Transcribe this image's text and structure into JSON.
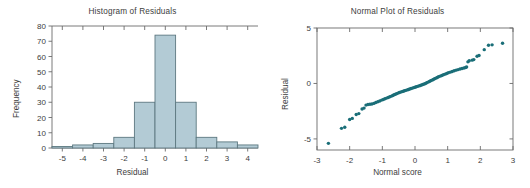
{
  "figure": {
    "panels": [
      "histogram-of-residuals",
      "normal-plot-of-residuals"
    ]
  },
  "colors": {
    "bar_fill": "#b3cbd5",
    "bar_edge": "#5d7880",
    "point": "#1a6e78",
    "axis": "#6b6b6b",
    "text": "#3d3d3d",
    "background": "#ffffff"
  },
  "histogram": {
    "title": "Histogram of Residuals",
    "xlabel": "Residual",
    "ylabel": "Frequency",
    "x_ticks": [
      "-5",
      "-4",
      "-3",
      "-2",
      "-1",
      "0",
      "1",
      "2",
      "3",
      "4"
    ],
    "y_ticks": [
      "0",
      "10",
      "20",
      "30",
      "40",
      "50",
      "60",
      "70",
      "80"
    ]
  },
  "normalplot": {
    "title": "Normal Plot of Residuals",
    "xlabel": "Normal score",
    "ylabel": "Residual",
    "x_ticks": [
      "-3",
      "-2",
      "-1",
      "0",
      "1",
      "2",
      "3"
    ],
    "y_ticks": [
      "-5",
      "0",
      "5"
    ]
  },
  "chart_data": [
    {
      "type": "bar",
      "title": "Histogram of Residuals",
      "xlabel": "Residual",
      "ylabel": "Frequency",
      "xlim": [
        -5.5,
        4.5
      ],
      "ylim": [
        0,
        80
      ],
      "grid": false,
      "legend": null,
      "bin_width": 1,
      "bin_centers": [
        -5,
        -4,
        -3,
        -2,
        -1,
        0,
        1,
        2,
        3,
        4
      ],
      "bin_edges": [
        -5.5,
        -4.5,
        -3.5,
        -2.5,
        -1.5,
        -0.5,
        0.5,
        1.5,
        2.5,
        3.5,
        4.5
      ],
      "categories": [
        "-5",
        "-4",
        "-3",
        "-2",
        "-1",
        "0",
        "1",
        "2",
        "3",
        "4"
      ],
      "values": [
        1,
        2,
        3,
        7,
        30,
        74,
        30,
        7,
        4,
        2
      ],
      "xtick_values": [
        -5,
        -4,
        -3,
        -2,
        -1,
        0,
        1,
        2,
        3,
        4
      ],
      "ytick_values": [
        0,
        10,
        20,
        30,
        40,
        50,
        60,
        70,
        80
      ]
    },
    {
      "type": "scatter",
      "title": "Normal Plot of Residuals",
      "xlabel": "Normal score",
      "ylabel": "Residual",
      "xlim": [
        -3,
        3
      ],
      "ylim": [
        -6,
        5
      ],
      "grid": false,
      "legend": null,
      "marker": "circle",
      "xtick_values": [
        -3,
        -2,
        -1,
        0,
        1,
        2,
        3
      ],
      "ytick_values": [
        -5,
        0,
        5
      ],
      "points": [
        [
          -2.65,
          -5.4
        ],
        [
          -2.25,
          -4.05
        ],
        [
          -2.15,
          -3.95
        ],
        [
          -2.0,
          -3.25
        ],
        [
          -1.92,
          -3.15
        ],
        [
          -1.8,
          -2.8
        ],
        [
          -1.72,
          -2.72
        ],
        [
          -1.62,
          -2.3
        ],
        [
          -1.56,
          -2.22
        ],
        [
          -1.5,
          -1.95
        ],
        [
          -1.44,
          -1.9
        ],
        [
          -1.38,
          -1.88
        ],
        [
          -1.32,
          -1.85
        ],
        [
          -1.26,
          -1.8
        ],
        [
          -1.2,
          -1.72
        ],
        [
          -1.14,
          -1.65
        ],
        [
          -1.08,
          -1.58
        ],
        [
          -1.02,
          -1.5
        ],
        [
          -0.97,
          -1.44
        ],
        [
          -0.92,
          -1.38
        ],
        [
          -0.87,
          -1.32
        ],
        [
          -0.82,
          -1.26
        ],
        [
          -0.77,
          -1.2
        ],
        [
          -0.72,
          -1.14
        ],
        [
          -0.68,
          -1.08
        ],
        [
          -0.64,
          -1.02
        ],
        [
          -0.6,
          -0.97
        ],
        [
          -0.56,
          -0.92
        ],
        [
          -0.52,
          -0.87
        ],
        [
          -0.48,
          -0.82
        ],
        [
          -0.44,
          -0.78
        ],
        [
          -0.4,
          -0.74
        ],
        [
          -0.36,
          -0.7
        ],
        [
          -0.32,
          -0.66
        ],
        [
          -0.28,
          -0.62
        ],
        [
          -0.24,
          -0.58
        ],
        [
          -0.2,
          -0.54
        ],
        [
          -0.16,
          -0.5
        ],
        [
          -0.12,
          -0.46
        ],
        [
          -0.08,
          -0.42
        ],
        [
          -0.04,
          -0.38
        ],
        [
          0.0,
          -0.34
        ],
        [
          0.04,
          -0.3
        ],
        [
          0.08,
          -0.26
        ],
        [
          0.12,
          -0.22
        ],
        [
          0.16,
          -0.18
        ],
        [
          0.2,
          -0.14
        ],
        [
          0.24,
          -0.1
        ],
        [
          0.28,
          -0.05
        ],
        [
          0.32,
          0.0
        ],
        [
          0.36,
          0.06
        ],
        [
          0.4,
          0.12
        ],
        [
          0.44,
          0.18
        ],
        [
          0.48,
          0.24
        ],
        [
          0.52,
          0.3
        ],
        [
          0.56,
          0.36
        ],
        [
          0.6,
          0.42
        ],
        [
          0.64,
          0.48
        ],
        [
          0.68,
          0.54
        ],
        [
          0.72,
          0.6
        ],
        [
          0.77,
          0.66
        ],
        [
          0.82,
          0.72
        ],
        [
          0.87,
          0.78
        ],
        [
          0.92,
          0.84
        ],
        [
          0.97,
          0.9
        ],
        [
          1.02,
          0.96
        ],
        [
          1.08,
          1.02
        ],
        [
          1.14,
          1.08
        ],
        [
          1.2,
          1.14
        ],
        [
          1.26,
          1.2
        ],
        [
          1.32,
          1.25
        ],
        [
          1.38,
          1.3
        ],
        [
          1.44,
          1.35
        ],
        [
          1.5,
          1.4
        ],
        [
          1.55,
          1.44
        ],
        [
          1.58,
          1.48
        ],
        [
          1.62,
          1.95
        ],
        [
          1.66,
          2.05
        ],
        [
          1.75,
          2.1
        ],
        [
          1.8,
          2.15
        ],
        [
          1.9,
          2.45
        ],
        [
          1.96,
          2.52
        ],
        [
          2.12,
          3.05
        ],
        [
          2.25,
          3.45
        ],
        [
          2.36,
          3.48
        ],
        [
          2.68,
          3.62
        ]
      ]
    }
  ]
}
